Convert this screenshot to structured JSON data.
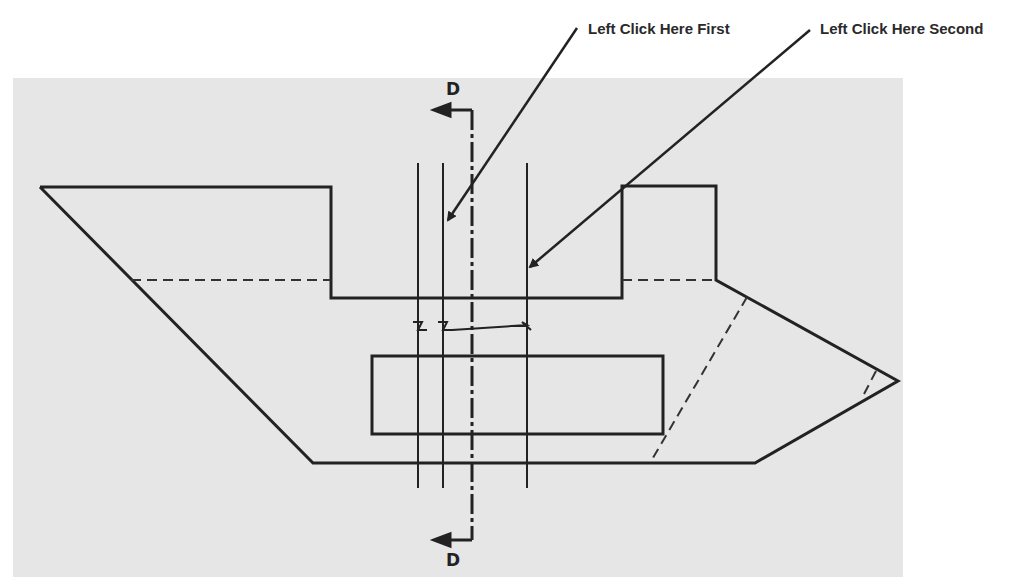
{
  "callouts": {
    "first": "Left Click Here First",
    "second": "Left Click Here Second"
  },
  "section": {
    "top_label": "D",
    "bottom_label": "D"
  },
  "colors": {
    "panel": "#e6e6e6",
    "line": "#222222"
  }
}
